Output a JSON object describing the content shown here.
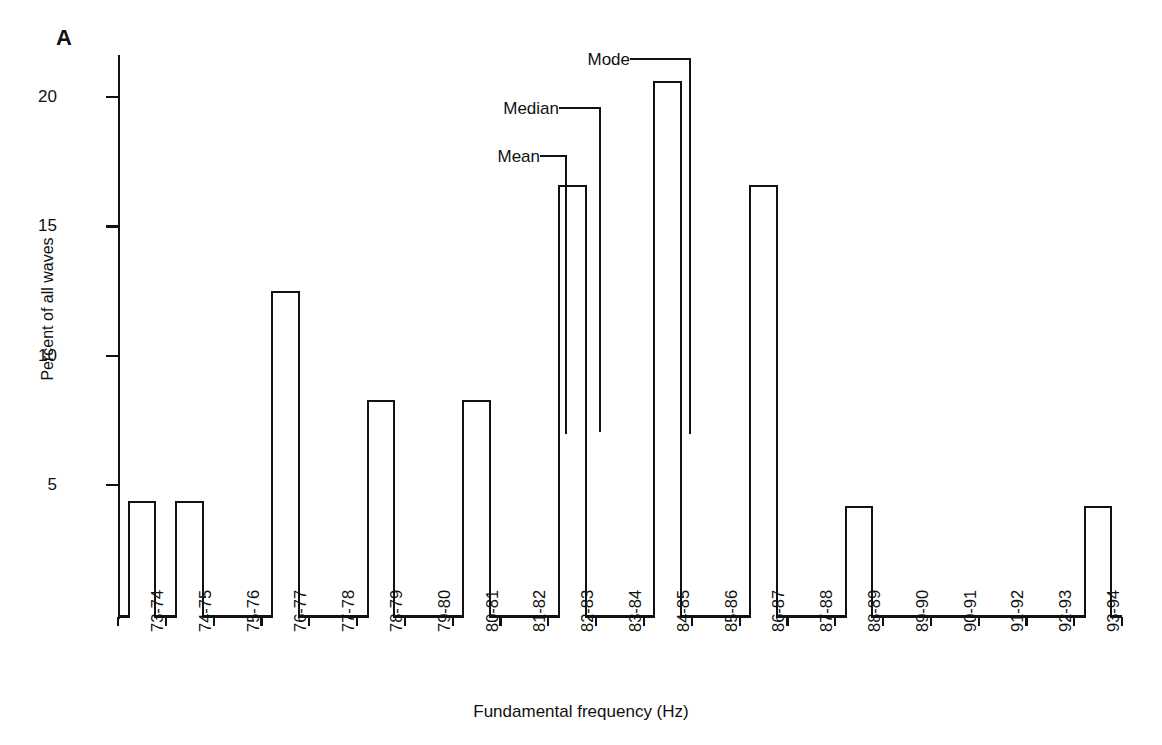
{
  "figure": {
    "panel_label": "A"
  },
  "chart_data": {
    "type": "bar",
    "title": "",
    "xlabel": "Fundamental frequency (Hz)",
    "ylabel": "Percent of all waves",
    "categories": [
      "73-74",
      "74-75",
      "75-76",
      "76-77",
      "77-78",
      "78-79",
      "79-80",
      "80-81",
      "81-82",
      "82-83",
      "83-84",
      "84-85",
      "85-86",
      "86-87",
      "87-88",
      "88-89",
      "89-90",
      "90-91",
      "91-92",
      "92-93",
      "93-94"
    ],
    "values": [
      4.4,
      4.4,
      0,
      12.5,
      0,
      8.3,
      0,
      8.3,
      0,
      16.6,
      0,
      20.6,
      0,
      16.6,
      0,
      4.2,
      0,
      0,
      0,
      0,
      4.2
    ],
    "ylim": [
      0,
      22
    ],
    "yticks": [
      5,
      10,
      15,
      20
    ],
    "ytick_labels": [
      "5",
      "10",
      "15",
      "20"
    ],
    "grid": false,
    "legend": false,
    "bar_style": "outlined-white-fill",
    "annotations": [
      {
        "name": "mean",
        "label": "Mean",
        "category": "82-83",
        "value": 82.5
      },
      {
        "name": "median",
        "label": "Median",
        "category": "82-83",
        "value": 83.0
      },
      {
        "name": "mode",
        "label": "Mode",
        "category": "84-85",
        "value": 84.5
      }
    ]
  },
  "colors": {
    "ink": "#111111",
    "background": "#ffffff"
  }
}
